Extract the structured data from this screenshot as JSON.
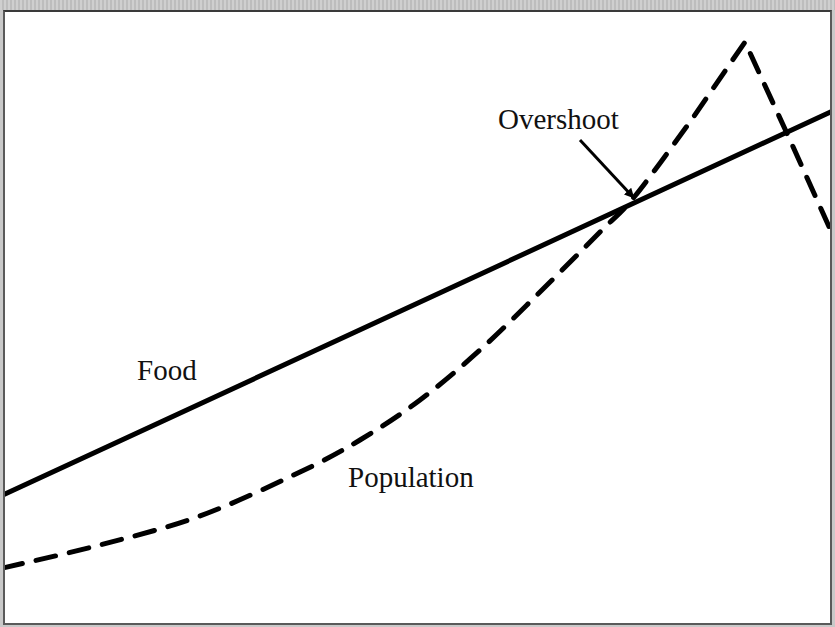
{
  "chart_data": {
    "type": "line",
    "title": "",
    "xlabel": "",
    "ylabel": "",
    "grid": false,
    "legend": "none (inline labels)",
    "series": [
      {
        "name": "Food",
        "style": "solid",
        "color": "#000000",
        "points_px": [
          [
            3,
            495
          ],
          [
            835,
            110
          ]
        ]
      },
      {
        "name": "Population",
        "style": "dashed",
        "color": "#000000",
        "points_px": [
          [
            3,
            568
          ],
          [
            100,
            545
          ],
          [
            200,
            516
          ],
          [
            300,
            472
          ],
          [
            360,
            440
          ],
          [
            420,
            400
          ],
          [
            480,
            350
          ],
          [
            540,
            292
          ],
          [
            600,
            232
          ],
          [
            635,
            196
          ],
          [
            690,
            122
          ],
          [
            745,
            42
          ],
          [
            790,
            140
          ],
          [
            835,
            240
          ]
        ]
      }
    ],
    "annotations": [
      {
        "text": "Overshoot",
        "arrow_from_px": [
          580,
          140
        ],
        "arrow_to_px": [
          633,
          197
        ]
      }
    ]
  },
  "labels": {
    "food": "Food",
    "population": "Population",
    "overshoot": "Overshoot"
  },
  "colors": {
    "line": "#000000",
    "background": "#ffffff",
    "outer": "#c9c9c9"
  }
}
